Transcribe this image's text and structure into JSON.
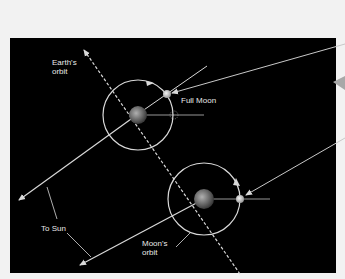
{
  "diagram": {
    "title": "",
    "background_color": "#000000",
    "line_color": "#d9d9d9",
    "labels": {
      "earths_orbit": "Earth's\norbit",
      "full_moon": "Full Moon",
      "to_sun": "To Sun",
      "moons_orbit": "Moon's\norbit"
    },
    "elements": [
      {
        "name": "earth-1",
        "desc": "Earth at first position with Moon's orbit circle"
      },
      {
        "name": "full-moon",
        "desc": "Moon at full phase, opposite the Sun"
      },
      {
        "name": "earth-2",
        "desc": "Earth at later position along orbit"
      },
      {
        "name": "moon-2",
        "desc": "Moon at later position"
      },
      {
        "name": "earth-orbit-path",
        "desc": "Dashed arrowed line showing Earth's orbit"
      },
      {
        "name": "sun-direction-arrows",
        "desc": "Two arrows pointing toward the Sun"
      }
    ]
  }
}
